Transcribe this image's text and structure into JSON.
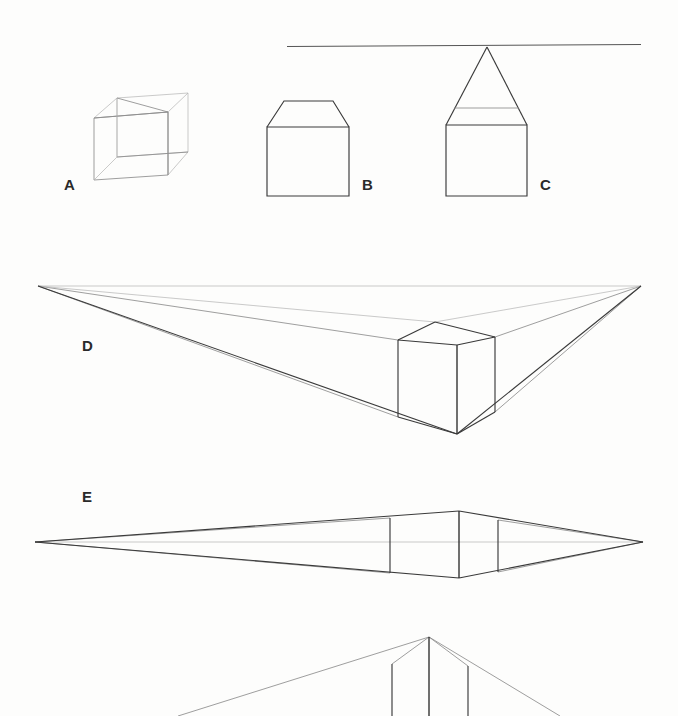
{
  "page": {
    "background_color": "#fdfdfc",
    "width": 678,
    "height": 716,
    "ink_color": "#3a3a3a",
    "light_ink_color": "#8c8c8c",
    "faint_ink_color": "#b3b3b3"
  },
  "labels": {
    "a": "A",
    "b": "B",
    "c": "C",
    "d": "D",
    "e": "E",
    "f": "F"
  },
  "figures": [
    {
      "id": "A",
      "label": "A",
      "name": "transparent-wireframe-cube",
      "description": "Faint see-through cube drawn in near-isometric view with all twelve edges visible",
      "label_position": {
        "x": 64,
        "y": 177
      }
    },
    {
      "id": "B",
      "label": "B",
      "name": "square-with-trapezoid-top",
      "description": "Flat square front face with a shallow trapezoid above it representing a foreshortened top plane",
      "label_position": {
        "x": 362,
        "y": 177
      }
    },
    {
      "id": "C",
      "label": "C",
      "name": "square-with-triangle-to-horizon",
      "description": "Flat square with converging lines rising to a single point that sits on the horizon line",
      "label_position": {
        "x": 540,
        "y": 177
      }
    },
    {
      "id": "D",
      "label": "D",
      "name": "two-point-perspective-cube-below-horizon",
      "description": "Cube drawn in two point perspective well below the eye level with construction lines running out to both vanishing points",
      "label_position": {
        "x": 82,
        "y": 338
      }
    },
    {
      "id": "E",
      "label": "E",
      "name": "two-point-perspective-cube-at-horizon",
      "description": "Cube drawn in two point perspective with the horizon line passing through its middle, producing a very flattened shape",
      "label_position": {
        "x": 82,
        "y": 489
      }
    },
    {
      "id": "F",
      "label": "F",
      "name": "two-point-perspective-cube-above-horizon",
      "description": "Partially visible cube drawn in two point perspective above the eye level, cropped by the bottom edge of the page",
      "label_position": {
        "x": 82,
        "y": 694
      }
    }
  ],
  "geometry": {
    "horizon_top": {
      "x1": 287,
      "y1": 46,
      "x2": 641,
      "y2": 44
    },
    "figure_a_cube": {
      "front_face": [
        [
          94,
          118
        ],
        [
          168,
          112
        ],
        [
          168,
          175
        ],
        [
          94,
          180
        ]
      ],
      "back_face": [
        [
          117,
          98
        ],
        [
          188,
          93
        ],
        [
          188,
          152
        ],
        [
          117,
          157
        ]
      ],
      "connectors": [
        [
          [
            94,
            118
          ],
          [
            117,
            98
          ]
        ],
        [
          [
            168,
            112
          ],
          [
            188,
            93
          ]
        ],
        [
          [
            168,
            175
          ],
          [
            188,
            152
          ]
        ],
        [
          [
            94,
            180
          ],
          [
            117,
            157
          ]
        ]
      ]
    },
    "figure_b": {
      "square": [
        [
          267,
          127
        ],
        [
          349,
          127
        ],
        [
          349,
          196
        ],
        [
          267,
          196
        ]
      ],
      "top_trapezoid": [
        [
          267,
          127
        ],
        [
          283,
          101
        ],
        [
          333,
          101
        ],
        [
          349,
          127
        ]
      ]
    },
    "figure_c": {
      "square": [
        [
          446,
          125
        ],
        [
          527,
          125
        ],
        [
          527,
          196
        ],
        [
          446,
          196
        ]
      ],
      "triangle_apex": [
        487,
        46
      ],
      "triangle_base": [
        [
          446,
          125
        ],
        [
          527,
          125
        ]
      ]
    },
    "figure_d": {
      "vanishing_point_left": [
        38,
        286
      ],
      "vanishing_point_right": [
        641,
        286
      ],
      "cube_front_vertical_top": [
        457,
        345
      ],
      "cube_front_vertical_bottom": [
        457,
        434
      ],
      "cube_left_vertical_top": [
        398,
        340
      ],
      "cube_left_vertical_bottom": [
        398,
        417
      ],
      "cube_right_vertical_top": [
        495,
        337
      ],
      "cube_right_vertical_bottom": [
        495,
        412
      ],
      "cube_back_top": [
        435,
        322
      ]
    },
    "figure_e": {
      "vanishing_point_left": [
        35,
        542
      ],
      "vanishing_point_right": [
        643,
        542
      ],
      "cube_front_vertical_top": [
        459,
        511
      ],
      "cube_front_vertical_bottom": [
        459,
        578
      ],
      "cube_left_vertical_top": [
        390,
        518
      ],
      "cube_left_vertical_bottom": [
        390,
        573
      ],
      "cube_right_vertical_top": [
        498,
        520
      ],
      "cube_right_vertical_bottom": [
        498,
        572
      ]
    },
    "figure_f": {
      "cube_front_vertical_top": [
        429,
        636
      ],
      "cube_left_vertical_top": [
        390,
        663
      ],
      "cube_right_vertical_top": [
        467,
        666
      ],
      "cropped_at_bottom": true
    }
  }
}
